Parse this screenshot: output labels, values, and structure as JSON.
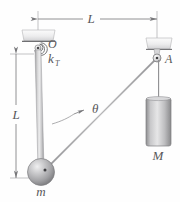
{
  "figure": {
    "background_color": "#fefefe",
    "line_color": "#6b6b6d",
    "label_color": "#58585a",
    "dimensions": {
      "width": 180,
      "height": 202
    }
  },
  "labels": {
    "dim_horizontal": "L",
    "dim_vertical": "L",
    "pivot_point": "O",
    "torsional_spring": "k",
    "torsional_spring_sub": "T",
    "angle": "θ",
    "pulley_point": "A",
    "hanging_mass": "M",
    "bob_mass": "m"
  },
  "elements": {
    "ceiling_support_left": "fixed-ceiling-support-left",
    "ceiling_support_right": "fixed-ceiling-support-right",
    "pivot_hinge": "pivot-at-O",
    "spiral_spring": "torsional-spring-coil",
    "rod": "rigid-rod-length-L",
    "sphere": "bob-mass-m",
    "cable": "cable-from-bob-to-pulley",
    "pulley": "pulley-at-A",
    "block": "hanging-block-mass-M",
    "block_cable": "cable-from-pulley-to-block",
    "angle_arc": "angle-theta-indicator",
    "dim_line_h": "horizontal-dimension-L",
    "dim_line_v": "vertical-dimension-L"
  },
  "geometry": {
    "pivot_O": {
      "x": 38,
      "y": 48
    },
    "bob_m": {
      "x": 41,
      "y": 172
    },
    "pulley_A": {
      "x": 157,
      "y": 58
    },
    "block_top": {
      "x": 157,
      "y": 97
    },
    "rod_length_px": 124,
    "horizontal_span_px": 119
  }
}
